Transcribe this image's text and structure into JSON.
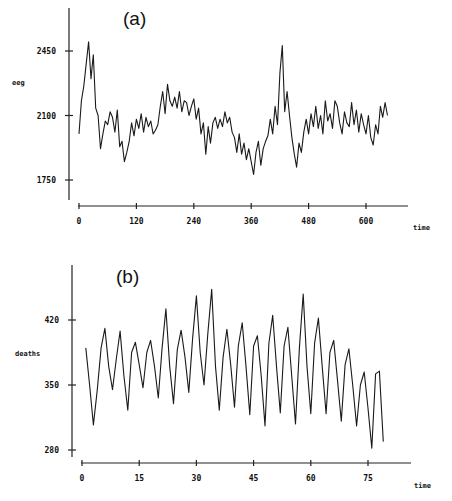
{
  "chart_data": [
    {
      "type": "line",
      "panel_label": "(a)",
      "title": "",
      "xlabel": "time",
      "ylabel": "eeg",
      "xticks": [
        0,
        120,
        240,
        360,
        480,
        600
      ],
      "xtick_labels": [
        "0",
        "120",
        "240",
        "360",
        "480",
        "600"
      ],
      "yticks": [
        1750,
        2100,
        2450
      ],
      "ytick_labels": [
        "1750",
        "2100",
        "2450"
      ],
      "xlim": [
        0,
        690
      ],
      "ylim": [
        1640,
        2700
      ],
      "grid": false,
      "legend": false,
      "series": [
        {
          "name": "eeg",
          "x": [
            0,
            5,
            10,
            15,
            20,
            25,
            30,
            35,
            40,
            45,
            50,
            55,
            60,
            65,
            70,
            75,
            80,
            85,
            90,
            95,
            100,
            105,
            110,
            115,
            120,
            125,
            130,
            135,
            140,
            145,
            150,
            155,
            160,
            165,
            170,
            175,
            180,
            185,
            190,
            195,
            200,
            205,
            210,
            215,
            220,
            225,
            230,
            235,
            240,
            245,
            250,
            255,
            260,
            265,
            270,
            275,
            280,
            285,
            290,
            295,
            300,
            305,
            310,
            315,
            320,
            325,
            330,
            335,
            340,
            345,
            350,
            355,
            360,
            365,
            370,
            375,
            380,
            385,
            390,
            395,
            400,
            405,
            410,
            415,
            420,
            425,
            430,
            435,
            440,
            445,
            450,
            455,
            460,
            465,
            470,
            475,
            480,
            485,
            490,
            495,
            500,
            505,
            510,
            515,
            520,
            525,
            530,
            535,
            540,
            545,
            550,
            555,
            560,
            565,
            570,
            575,
            580,
            585,
            590,
            595,
            600,
            605,
            610,
            615,
            620,
            625,
            630,
            635,
            640,
            645
          ],
          "values": [
            2000,
            2180,
            2260,
            2380,
            2500,
            2300,
            2430,
            2140,
            2100,
            1920,
            2000,
            2070,
            2050,
            2120,
            2090,
            2010,
            2130,
            1930,
            1960,
            1850,
            1900,
            1960,
            2060,
            1990,
            2080,
            2030,
            2110,
            2010,
            2090,
            2040,
            2070,
            2000,
            2020,
            2050,
            2150,
            2230,
            2110,
            2270,
            2180,
            2150,
            2200,
            2140,
            2230,
            2120,
            2180,
            2170,
            2100,
            2150,
            2190,
            2080,
            2140,
            2000,
            2060,
            1890,
            2040,
            1950,
            2060,
            2090,
            2030,
            2080,
            2040,
            2120,
            2060,
            2090,
            2010,
            1980,
            1900,
            2000,
            1890,
            1950,
            1860,
            1920,
            1850,
            1780,
            1900,
            1960,
            1830,
            1920,
            1960,
            1990,
            2080,
            2000,
            2150,
            2050,
            2330,
            2480,
            2120,
            2230,
            2100,
            1980,
            1890,
            1820,
            1950,
            1900,
            2010,
            2080,
            2000,
            2110,
            2040,
            2150,
            2030,
            2100,
            2000,
            2180,
            2070,
            2110,
            2030,
            2180,
            2150,
            2060,
            2000,
            2120,
            2060,
            2040,
            2170,
            2050,
            2130,
            2010,
            2110,
            2050,
            2000,
            2100,
            1980,
            1940,
            2050,
            2000,
            2150,
            2090,
            2170,
            2100,
            2200,
            2120,
            2080,
            2150,
            2190,
            2060,
            2140,
            2200,
            2100,
            2050
          ],
          "notes": "High-frequency noisy EEG trace, approx. sampled; spikes near t≈25 (~2500) and t≈410 (~2500)"
        }
      ]
    },
    {
      "type": "line",
      "panel_label": "(b)",
      "title": "",
      "xlabel": "time",
      "ylabel": "deaths",
      "xticks": [
        0,
        15,
        30,
        45,
        60,
        75
      ],
      "xtick_labels": [
        "0",
        "15",
        "30",
        "45",
        "60",
        "75"
      ],
      "yticks": [
        280,
        350,
        420
      ],
      "ytick_labels": [
        "280",
        "350",
        "420"
      ],
      "xlim": [
        0,
        86
      ],
      "ylim": [
        272,
        480
      ],
      "grid": false,
      "legend": false,
      "series": [
        {
          "name": "deaths",
          "x": [
            1,
            2,
            3,
            4,
            5,
            6,
            7,
            8,
            9,
            10,
            11,
            12,
            13,
            14,
            15,
            16,
            17,
            18,
            19,
            20,
            21,
            22,
            23,
            24,
            25,
            26,
            27,
            28,
            29,
            30,
            31,
            32,
            33,
            34,
            35,
            36,
            37,
            38,
            39,
            40,
            41,
            42,
            43,
            44,
            45,
            46,
            47,
            48,
            49,
            50,
            51,
            52,
            53,
            54,
            55,
            56,
            57,
            58,
            59,
            60,
            61,
            62,
            63,
            64,
            65,
            66,
            67,
            68,
            69,
            70,
            71,
            72,
            73,
            74,
            75,
            76,
            77,
            78,
            79
          ],
          "values": [
            390,
            350,
            307,
            345,
            390,
            411,
            370,
            345,
            378,
            408,
            360,
            323,
            385,
            396,
            372,
            347,
            385,
            398,
            370,
            336,
            390,
            432,
            370,
            330,
            388,
            409,
            380,
            342,
            400,
            446,
            385,
            350,
            405,
            453,
            370,
            323,
            380,
            410,
            372,
            326,
            392,
            417,
            370,
            318,
            392,
            403,
            360,
            306,
            395,
            425,
            370,
            320,
            392,
            412,
            360,
            308,
            390,
            448,
            370,
            319,
            395,
            422,
            370,
            319,
            385,
            398,
            355,
            311,
            372,
            389,
            350,
            306,
            350,
            364,
            325,
            282,
            362,
            365,
            289
          ]
        }
      ]
    }
  ]
}
